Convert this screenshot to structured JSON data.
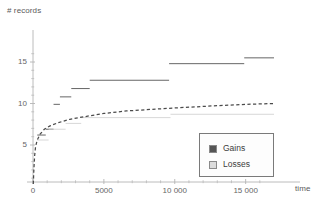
{
  "chart_data": {
    "type": "line",
    "title": "",
    "xlabel": "time",
    "ylabel": "# records",
    "xlim": [
      0,
      17000
    ],
    "ylim": [
      0,
      17
    ],
    "xticks": [
      0,
      5000,
      10000,
      15000
    ],
    "xtick_labels": [
      "0",
      "5000",
      "10 000",
      "15 000"
    ],
    "yticks": [
      5,
      10,
      15
    ],
    "ytick_labels": [
      "5",
      "10",
      "15"
    ],
    "grid": false,
    "legend_position": "lower-right",
    "series": [
      {
        "name": "Gains",
        "type": "step",
        "color": "#555555",
        "style": "solid",
        "steps": [
          {
            "x_start": 300,
            "x_end": 900,
            "y": 6.2
          },
          {
            "x_start": 900,
            "x_end": 1450,
            "y": 6.9
          },
          {
            "x_start": 1450,
            "x_end": 1900,
            "y": 9.9
          },
          {
            "x_start": 1900,
            "x_end": 2700,
            "y": 10.8
          },
          {
            "x_start": 2700,
            "x_end": 4000,
            "y": 11.8
          },
          {
            "x_start": 4000,
            "x_end": 9600,
            "y": 12.8
          },
          {
            "x_start": 9600,
            "x_end": 14900,
            "y": 14.8
          },
          {
            "x_start": 14900,
            "x_end": 17000,
            "y": 15.5
          }
        ]
      },
      {
        "name": "Losses",
        "type": "step",
        "color": "#d2d2d2",
        "style": "solid",
        "steps": [
          {
            "x_start": 300,
            "x_end": 1100,
            "y": 5.6
          },
          {
            "x_start": 1100,
            "x_end": 2300,
            "y": 6.9
          },
          {
            "x_start": 2300,
            "x_end": 3400,
            "y": 7.6
          },
          {
            "x_start": 3400,
            "x_end": 9700,
            "y": 8.3
          },
          {
            "x_start": 9700,
            "x_end": 17000,
            "y": 8.7
          }
        ]
      },
      {
        "name": "Fit",
        "type": "line",
        "color": "#4a4a4a",
        "style": "dashed",
        "points": [
          {
            "x": 20,
            "y": 0.3
          },
          {
            "x": 60,
            "y": 2.0
          },
          {
            "x": 110,
            "y": 3.6
          },
          {
            "x": 180,
            "y": 4.8
          },
          {
            "x": 300,
            "y": 5.6
          },
          {
            "x": 500,
            "y": 6.3
          },
          {
            "x": 800,
            "y": 6.9
          },
          {
            "x": 1200,
            "y": 7.3
          },
          {
            "x": 1800,
            "y": 7.7
          },
          {
            "x": 2600,
            "y": 8.1
          },
          {
            "x": 3600,
            "y": 8.4
          },
          {
            "x": 5000,
            "y": 8.8
          },
          {
            "x": 6600,
            "y": 9.1
          },
          {
            "x": 8400,
            "y": 9.3
          },
          {
            "x": 10400,
            "y": 9.5
          },
          {
            "x": 12600,
            "y": 9.7
          },
          {
            "x": 15000,
            "y": 9.9
          },
          {
            "x": 17000,
            "y": 10.0
          }
        ]
      }
    ]
  },
  "axes": {
    "ylabel": "# records",
    "xlabel": "time",
    "xtick_labels": [
      "0",
      "5000",
      "10 000",
      "15 000"
    ],
    "ytick_labels": [
      "5",
      "10",
      "15"
    ],
    "axis_color": "#b4b4b4"
  },
  "legend": {
    "entries": [
      {
        "label": "Gains",
        "color": "#555555"
      },
      {
        "label": "Losses",
        "color": "#dcdcdc"
      }
    ]
  }
}
